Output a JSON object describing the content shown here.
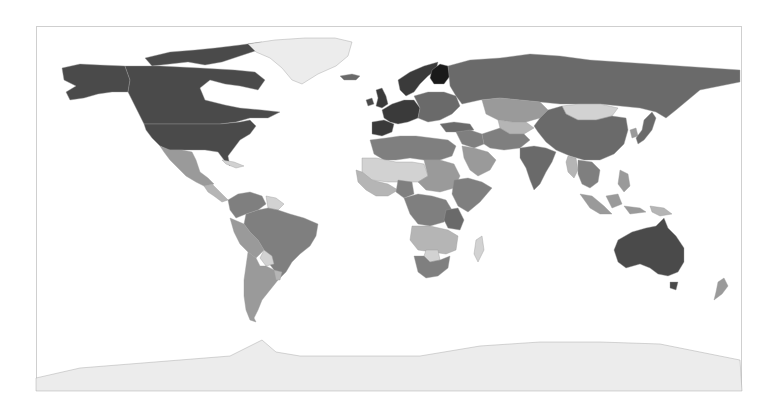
{
  "map": {
    "type": "choropleth",
    "projection": "equirectangular",
    "color_scheme": "grayscale",
    "frame": {
      "x": 36,
      "y": 26,
      "width": 706,
      "height": 365,
      "border": "#cfcfcf"
    },
    "ocean_color": "#ffffff",
    "legend": null,
    "title": null
  },
  "palette": {
    "darkest": "#1a1a1a",
    "very_dark": "#3a3a3a",
    "dark": "#4a4a4a",
    "medium_dark": "#6a6a6a",
    "medium": "#7f7f7f",
    "medium_light": "#9a9a9a",
    "light": "#b5b5b5",
    "very_light": "#d2d2d2",
    "ice": "#ececec"
  },
  "regions": [
    {
      "name": "Canada",
      "shade": "dark"
    },
    {
      "name": "Canadian Arctic Islands",
      "shade": "dark"
    },
    {
      "name": "Alaska",
      "shade": "dark"
    },
    {
      "name": "United States",
      "shade": "dark"
    },
    {
      "name": "Greenland",
      "shade": "ice"
    },
    {
      "name": "Iceland",
      "shade": "medium_dark"
    },
    {
      "name": "Mexico",
      "shade": "medium_light"
    },
    {
      "name": "Central America",
      "shade": "light"
    },
    {
      "name": "Cuba",
      "shade": "very_light"
    },
    {
      "name": "Venezuela/Colombia",
      "shade": "medium"
    },
    {
      "name": "Guianas",
      "shade": "very_light"
    },
    {
      "name": "Brazil",
      "shade": "medium"
    },
    {
      "name": "Peru/Bolivia",
      "shade": "medium_light"
    },
    {
      "name": "Paraguay",
      "shade": "very_light"
    },
    {
      "name": "Argentina/Chile",
      "shade": "medium_light"
    },
    {
      "name": "Uruguay",
      "shade": "light"
    },
    {
      "name": "United Kingdom",
      "shade": "very_dark"
    },
    {
      "name": "Ireland",
      "shade": "dark"
    },
    {
      "name": "Scandinavia",
      "shade": "very_dark"
    },
    {
      "name": "Finland",
      "shade": "darkest"
    },
    {
      "name": "Western Europe",
      "shade": "very_dark"
    },
    {
      "name": "Iberia",
      "shade": "very_dark"
    },
    {
      "name": "Eastern Europe",
      "shade": "medium_dark"
    },
    {
      "name": "Russia",
      "shade": "medium_dark"
    },
    {
      "name": "Kazakhstan",
      "shade": "medium_light"
    },
    {
      "name": "Central Asia",
      "shade": "light"
    },
    {
      "name": "Mongolia",
      "shade": "very_light"
    },
    {
      "name": "China",
      "shade": "medium_dark"
    },
    {
      "name": "Turkey",
      "shade": "medium_dark"
    },
    {
      "name": "Middle East",
      "shade": "medium"
    },
    {
      "name": "Arabian Peninsula",
      "shade": "medium_light"
    },
    {
      "name": "Iran/Afghanistan",
      "shade": "medium"
    },
    {
      "name": "India",
      "shade": "medium_dark"
    },
    {
      "name": "Southeast Asia",
      "shade": "medium"
    },
    {
      "name": "Myanmar",
      "shade": "light"
    },
    {
      "name": "Japan",
      "shade": "medium_dark"
    },
    {
      "name": "Korea",
      "shade": "medium_light"
    },
    {
      "name": "Indonesia",
      "shade": "medium_light"
    },
    {
      "name": "Philippines",
      "shade": "medium_light"
    },
    {
      "name": "Papua New Guinea",
      "shade": "light"
    },
    {
      "name": "Australia",
      "shade": "dark"
    },
    {
      "name": "Tasmania",
      "shade": "dark"
    },
    {
      "name": "New Zealand",
      "shade": "medium_light"
    },
    {
      "name": "North Africa",
      "shade": "medium"
    },
    {
      "name": "Sahel",
      "shade": "very_light"
    },
    {
      "name": "West Africa",
      "shade": "light"
    },
    {
      "name": "Nigeria",
      "shade": "medium"
    },
    {
      "name": "Sudan/Chad",
      "shade": "medium_light"
    },
    {
      "name": "Ethiopia/Horn",
      "shade": "medium"
    },
    {
      "name": "Central Africa",
      "shade": "medium"
    },
    {
      "name": "Tanzania",
      "shade": "medium_dark"
    },
    {
      "name": "Southern Africa",
      "shade": "light"
    },
    {
      "name": "Botswana",
      "shade": "very_light"
    },
    {
      "name": "South Africa",
      "shade": "medium"
    },
    {
      "name": "Madagascar",
      "shade": "very_light"
    },
    {
      "name": "Antarctica",
      "shade": "ice"
    }
  ]
}
